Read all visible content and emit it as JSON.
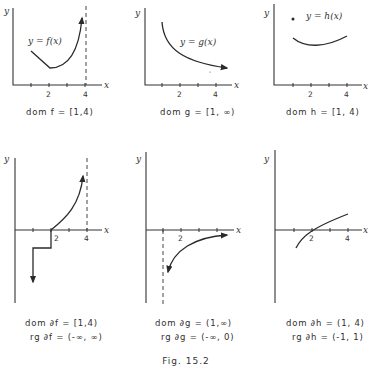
{
  "figure": {
    "caption": "Fig. 15.2"
  },
  "panels_top": [
    {
      "id": "f",
      "curve_label": "y = f(x)",
      "axis_x": "x",
      "axis_y": "y",
      "ticks": [
        "2",
        "4"
      ],
      "caption": "dom  f = [1,4)"
    },
    {
      "id": "g",
      "curve_label": "y = g(x)",
      "axis_x": "x",
      "axis_y": "y",
      "ticks": [
        "2",
        "4"
      ],
      "caption": "dom  g = [1, ∞)"
    },
    {
      "id": "h",
      "curve_label": "y = h(x)",
      "axis_x": "x",
      "axis_y": "y",
      "ticks": [
        "2",
        "4"
      ],
      "caption": "dom  h = [1, 4)"
    }
  ],
  "panels_bottom": [
    {
      "id": "df",
      "axis_x": "x",
      "axis_y": "y",
      "ticks": [
        "2",
        "4"
      ],
      "dom": "dom  ∂f = [1,4)",
      "rg": "rg  ∂f = (-∞, ∞)"
    },
    {
      "id": "dg",
      "axis_x": "x",
      "axis_y": "y",
      "ticks": [
        "2"
      ],
      "dom": "dom  ∂g = (1,∞)",
      "rg": "rg  ∂g = (-∞, 0)"
    },
    {
      "id": "dh",
      "axis_x": "x",
      "axis_y": "y",
      "ticks": [
        "2",
        "4"
      ],
      "dom": "dom  ∂h = (1, 4)",
      "rg": "rg  ∂h = (-1, 1)"
    }
  ]
}
